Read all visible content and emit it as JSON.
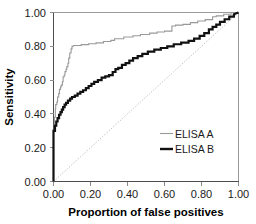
{
  "chart_data": {
    "type": "line",
    "title": "",
    "xlabel": "Proportion of false positives",
    "ylabel": "Sensitivity",
    "xlim": [
      0.0,
      1.0
    ],
    "ylim": [
      0.0,
      1.0
    ],
    "xticks": [
      "0.00",
      "0.20",
      "0.40",
      "0.60",
      "0.80",
      "1.00"
    ],
    "yticks": [
      "0.00",
      "0.20",
      "0.40",
      "0.60",
      "0.80",
      "1.00"
    ],
    "xtick_values": [
      0.0,
      0.2,
      0.4,
      0.6,
      0.8,
      1.0
    ],
    "ytick_values": [
      0.0,
      0.2,
      0.4,
      0.6,
      0.8,
      1.0
    ],
    "grid": false,
    "legend_position": "inside-lower-right",
    "reference_line": {
      "name": "chance-diagonal",
      "style": "dotted",
      "color": "#b3b3b3",
      "x": [
        0.0,
        1.0
      ],
      "y": [
        0.0,
        1.0
      ]
    },
    "series": [
      {
        "name": "ELISA A",
        "color": "#999999",
        "line_width": "thin",
        "x": [
          0.0,
          0.0,
          0.005,
          0.005,
          0.01,
          0.01,
          0.012,
          0.012,
          0.018,
          0.018,
          0.022,
          0.022,
          0.028,
          0.028,
          0.032,
          0.032,
          0.038,
          0.038,
          0.042,
          0.042,
          0.048,
          0.048,
          0.052,
          0.052,
          0.058,
          0.058,
          0.062,
          0.062,
          0.068,
          0.068,
          0.072,
          0.072,
          0.078,
          0.078,
          0.082,
          0.082,
          0.088,
          0.088,
          0.095,
          0.095,
          0.1,
          0.1,
          0.108,
          0.108,
          0.15,
          0.15,
          0.19,
          0.19,
          0.23,
          0.23,
          0.27,
          0.27,
          0.31,
          0.31,
          0.33,
          0.33,
          0.38,
          0.38,
          0.43,
          0.43,
          0.47,
          0.47,
          0.52,
          0.52,
          0.56,
          0.56,
          0.6,
          0.6,
          0.64,
          0.64,
          0.66,
          0.66,
          0.7,
          0.7,
          0.74,
          0.74,
          0.78,
          0.78,
          0.82,
          0.82,
          0.86,
          0.86,
          0.88,
          0.88,
          0.92,
          0.92,
          0.96,
          0.96,
          1.0
        ],
        "y": [
          0.0,
          0.3,
          0.3,
          0.38,
          0.38,
          0.43,
          0.43,
          0.455,
          0.455,
          0.47,
          0.47,
          0.5,
          0.5,
          0.52,
          0.52,
          0.545,
          0.545,
          0.56,
          0.56,
          0.57,
          0.57,
          0.59,
          0.59,
          0.62,
          0.62,
          0.63,
          0.63,
          0.65,
          0.65,
          0.665,
          0.665,
          0.68,
          0.68,
          0.7,
          0.7,
          0.73,
          0.73,
          0.76,
          0.76,
          0.785,
          0.785,
          0.8,
          0.8,
          0.805,
          0.805,
          0.81,
          0.81,
          0.815,
          0.815,
          0.82,
          0.82,
          0.828,
          0.828,
          0.835,
          0.835,
          0.845,
          0.845,
          0.855,
          0.855,
          0.862,
          0.862,
          0.87,
          0.87,
          0.878,
          0.878,
          0.885,
          0.885,
          0.89,
          0.89,
          0.92,
          0.92,
          0.925,
          0.925,
          0.93,
          0.93,
          0.94,
          0.94,
          0.95,
          0.95,
          0.958,
          0.958,
          0.975,
          0.975,
          0.98,
          0.98,
          0.99,
          0.99,
          1.0,
          1.0
        ]
      },
      {
        "name": "ELISA B",
        "color": "#111111",
        "line_width": "thick",
        "x": [
          0.0,
          0.0,
          0.008,
          0.008,
          0.015,
          0.015,
          0.022,
          0.022,
          0.03,
          0.03,
          0.038,
          0.038,
          0.045,
          0.045,
          0.052,
          0.052,
          0.06,
          0.06,
          0.068,
          0.068,
          0.078,
          0.078,
          0.09,
          0.09,
          0.1,
          0.1,
          0.115,
          0.115,
          0.13,
          0.13,
          0.145,
          0.145,
          0.16,
          0.16,
          0.175,
          0.175,
          0.19,
          0.19,
          0.205,
          0.205,
          0.22,
          0.22,
          0.24,
          0.24,
          0.26,
          0.26,
          0.28,
          0.28,
          0.3,
          0.3,
          0.32,
          0.32,
          0.335,
          0.335,
          0.35,
          0.35,
          0.37,
          0.37,
          0.39,
          0.39,
          0.41,
          0.41,
          0.43,
          0.43,
          0.455,
          0.455,
          0.48,
          0.48,
          0.51,
          0.51,
          0.545,
          0.545,
          0.58,
          0.58,
          0.615,
          0.615,
          0.65,
          0.65,
          0.69,
          0.69,
          0.73,
          0.73,
          0.76,
          0.76,
          0.79,
          0.79,
          0.815,
          0.815,
          0.84,
          0.84,
          0.86,
          0.86,
          0.88,
          0.88,
          0.9,
          0.9,
          0.925,
          0.925,
          0.95,
          0.95,
          0.975,
          0.975,
          1.0
        ],
        "y": [
          0.0,
          0.3,
          0.3,
          0.33,
          0.33,
          0.355,
          0.355,
          0.375,
          0.375,
          0.395,
          0.395,
          0.41,
          0.41,
          0.425,
          0.425,
          0.44,
          0.44,
          0.455,
          0.455,
          0.465,
          0.465,
          0.478,
          0.478,
          0.49,
          0.49,
          0.5,
          0.5,
          0.508,
          0.508,
          0.52,
          0.52,
          0.53,
          0.53,
          0.54,
          0.54,
          0.552,
          0.552,
          0.565,
          0.565,
          0.578,
          0.578,
          0.59,
          0.59,
          0.6,
          0.6,
          0.615,
          0.615,
          0.622,
          0.622,
          0.63,
          0.63,
          0.648,
          0.648,
          0.665,
          0.665,
          0.672,
          0.672,
          0.69,
          0.69,
          0.7,
          0.7,
          0.715,
          0.715,
          0.73,
          0.73,
          0.742,
          0.742,
          0.755,
          0.755,
          0.768,
          0.768,
          0.78,
          0.78,
          0.79,
          0.79,
          0.8,
          0.8,
          0.812,
          0.812,
          0.822,
          0.822,
          0.832,
          0.832,
          0.845,
          0.845,
          0.862,
          0.862,
          0.878,
          0.878,
          0.9,
          0.9,
          0.915,
          0.915,
          0.928,
          0.928,
          0.945,
          0.945,
          0.96,
          0.96,
          0.975,
          0.975,
          0.99,
          1.0
        ]
      }
    ]
  },
  "legend": {
    "items": [
      {
        "label": "ELISA A"
      },
      {
        "label": "ELISA B"
      }
    ]
  }
}
